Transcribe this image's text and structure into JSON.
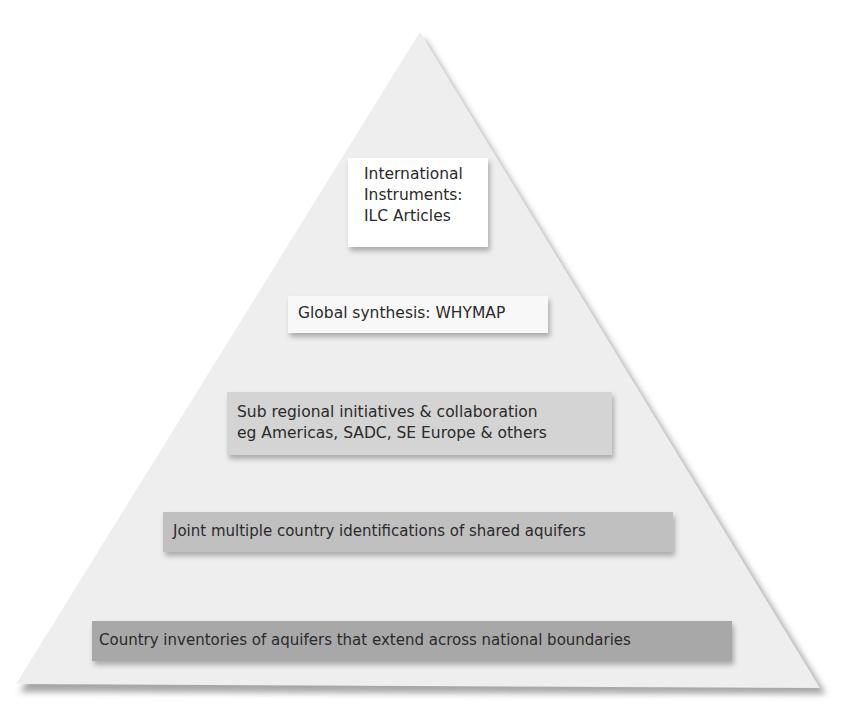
{
  "diagram": {
    "type": "pyramid",
    "colors": {
      "pyramid_fill": "#eeeeee",
      "pyramid_shadow": "#9a9a9a",
      "text": "#2a2a2a"
    },
    "tiers": [
      {
        "level": 1,
        "lines": [
          "International",
          "Instruments:",
          "ILC Articles"
        ],
        "fill": "#ffffff"
      },
      {
        "level": 2,
        "lines": [
          "Global synthesis: WHYMAP"
        ],
        "fill": "#f8f8f8"
      },
      {
        "level": 3,
        "lines": [
          "Sub regional initiatives & collaboration",
          "eg Americas, SADC, SE Europe & others"
        ],
        "fill": "#d4d4d4"
      },
      {
        "level": 4,
        "lines": [
          "Joint multiple country identifications of shared aquifers"
        ],
        "fill": "#c0c0c0"
      },
      {
        "level": 5,
        "lines": [
          "Country inventories of aquifers that extend across national boundaries"
        ],
        "fill": "#a8a8a8"
      }
    ]
  }
}
